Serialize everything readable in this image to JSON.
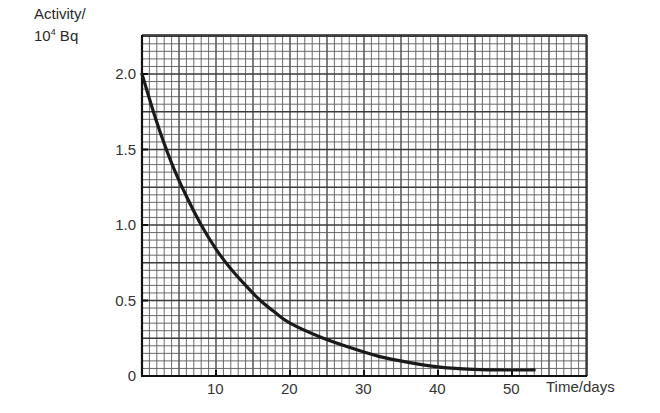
{
  "chart_data": {
    "type": "line",
    "title": "",
    "ylabel_line1": "Activity/",
    "ylabel_line2_base": "10",
    "ylabel_line2_exp": "4",
    "ylabel_line2_unit": " Bq",
    "xlabel": "Time/days",
    "xlim": [
      0,
      60
    ],
    "ylim": [
      0,
      2.2
    ],
    "x_ticks": [
      10,
      20,
      30,
      40,
      50
    ],
    "x_tick_labels": [
      "10",
      "20",
      "30",
      "40",
      "50"
    ],
    "y_ticks": [
      0,
      0.5,
      1.0,
      1.5,
      2.0
    ],
    "y_tick_labels": [
      "0",
      "0.5",
      "1.0",
      "1.5",
      "2.0"
    ],
    "grid": true,
    "grid_minor_x": 1,
    "grid_minor_y": 0.05,
    "legend": null,
    "series": [
      {
        "name": "Activity",
        "x": [
          0,
          2,
          4,
          6,
          8,
          10,
          12,
          14,
          16,
          18,
          20,
          24,
          28,
          32,
          36,
          40,
          44,
          48,
          53
        ],
        "values": [
          2.0,
          1.68,
          1.41,
          1.19,
          1.0,
          0.84,
          0.71,
          0.6,
          0.5,
          0.42,
          0.35,
          0.26,
          0.19,
          0.13,
          0.09,
          0.06,
          0.045,
          0.04,
          0.04
        ]
      }
    ],
    "annotations": [
      "half-life approx. 8 days"
    ]
  }
}
